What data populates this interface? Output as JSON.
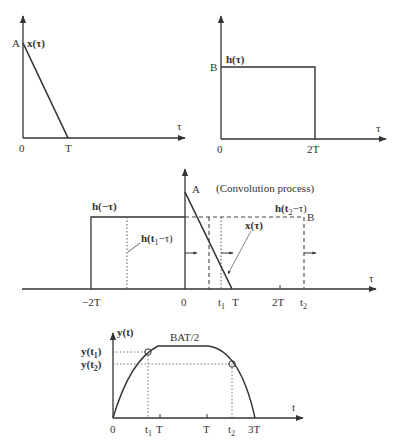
{
  "panels": {
    "x_signal": {
      "function_label": "x(τ)",
      "amplitude_label": "A",
      "origin_label": "0",
      "end_label": "T",
      "axis_label": "τ"
    },
    "h_signal": {
      "function_label": "h(τ)",
      "amplitude_label": "B",
      "origin_label": "0",
      "end_label": "2T",
      "axis_label": "τ"
    },
    "convolution": {
      "title": "(Convolution process)",
      "amplitude_A": "A",
      "amplitude_B": "B",
      "h_flipped_label": "h(−τ)",
      "h_t1_label_main": "h(t",
      "h_t1_label_sub": "1",
      "h_t1_label_end": "−τ)",
      "h_t2_label_main": "h(t",
      "h_t2_label_sub": "2",
      "h_t2_label_end": "−τ)",
      "x_label": "x(τ)",
      "axis_label": "τ",
      "ticks": {
        "neg2T": "−2T",
        "zero": "0",
        "t1": "t",
        "t1_sub": "1",
        "T": "T",
        "twoT": "2T",
        "t2": "t",
        "t2_sub": "2"
      }
    },
    "output": {
      "function_label": "y(t)",
      "peak_label": "BAT/2",
      "y_t1_main": "y(t",
      "y_t1_sub": "1",
      "y_t1_end": ")",
      "y_t2_main": "y(t",
      "y_t2_sub": "2",
      "y_t2_end": ")",
      "axis_label": "t",
      "ticks": {
        "zero": "0",
        "t1": "t",
        "t1_sub": "1",
        "T1": "T",
        "T2": "T",
        "t2": "t",
        "t2_sub": "2",
        "threeT": "3T"
      }
    }
  },
  "colors": {
    "line": "#333333",
    "thin": "#666666"
  }
}
